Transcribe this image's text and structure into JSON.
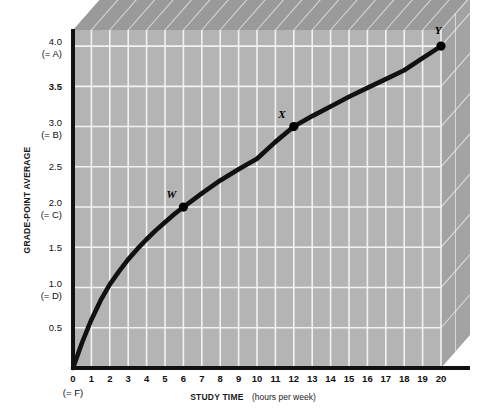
{
  "figure": {
    "background_color": "#ffffff",
    "plot_face_color": "#b4b4b4",
    "plot_top_face_color": "#9a9a9a",
    "plot_right_face_color": "#a3a3a3",
    "grid_color": "#f2f2f2",
    "axis_color": "#111111",
    "curve_color": "#111111",
    "marker_color": "#000000"
  },
  "chart_data": {
    "type": "line",
    "title": "",
    "xlabel": "STUDY TIME",
    "xlabel_suffix": "(hours per week)",
    "ylabel": "GRADE-POINT AVERAGE",
    "xlim": [
      0,
      20
    ],
    "ylim": [
      0,
      4.2
    ],
    "grid": true,
    "legend": "none",
    "x_ticks": [
      0,
      1,
      2,
      3,
      4,
      5,
      6,
      7,
      8,
      9,
      10,
      11,
      12,
      13,
      14,
      15,
      16,
      17,
      18,
      19,
      20
    ],
    "x_tick_labels": [
      "0",
      "1",
      "2",
      "3",
      "4",
      "5",
      "6",
      "7",
      "8",
      "9",
      "10",
      "11",
      "12",
      "13",
      "14",
      "15",
      "16",
      "17",
      "18",
      "19",
      "20"
    ],
    "x_origin_sublabel": "(= F)",
    "y_ticks": [
      0.5,
      1.0,
      1.5,
      2.0,
      2.5,
      3.0,
      3.5,
      4.0
    ],
    "y_tick_labels": [
      "0.5",
      "1.0",
      "1.5",
      "2.0",
      "2.5",
      "3.0",
      "3.5",
      "4.0"
    ],
    "y_tick_sublabels": [
      "",
      "(= D)",
      "",
      "(= C)",
      "",
      "(= B)",
      "",
      "(= A)"
    ],
    "grade_scale": {
      "4.0": "A",
      "3.0": "B",
      "2.0": "C",
      "1.0": "D",
      "0": "F"
    },
    "series": [
      {
        "name": "Grade-point average vs study time",
        "x": [
          0,
          0.5,
          1,
          1.5,
          2,
          2.5,
          3,
          3.5,
          4,
          4.5,
          5,
          5.5,
          6,
          7,
          8,
          9,
          10,
          11,
          12,
          13,
          14,
          15,
          16,
          17,
          18,
          19,
          20
        ],
        "y": [
          0,
          0.32,
          0.6,
          0.84,
          1.04,
          1.2,
          1.35,
          1.48,
          1.6,
          1.71,
          1.81,
          1.91,
          2.0,
          2.17,
          2.33,
          2.47,
          2.6,
          2.81,
          3.0,
          3.13,
          3.25,
          3.37,
          3.48,
          3.59,
          3.7,
          3.85,
          4.0
        ]
      }
    ],
    "annotated_points": [
      {
        "label": "W",
        "x": 6,
        "y": 2.0,
        "label_dx": -12,
        "label_dy": -9
      },
      {
        "label": "X",
        "x": 12,
        "y": 3.0,
        "label_dx": -12,
        "label_dy": -9
      },
      {
        "label": "Y",
        "x": 20,
        "y": 4.0,
        "label_dx": -3,
        "label_dy": -12
      }
    ]
  }
}
